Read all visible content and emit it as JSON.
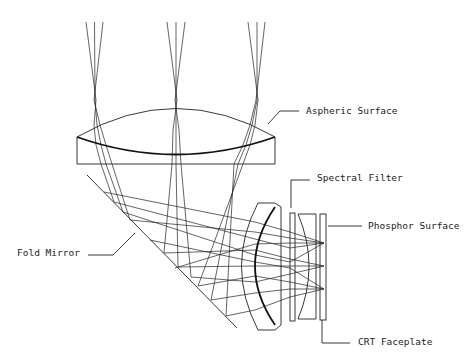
{
  "diagram": {
    "labels": {
      "aspheric_surface": "Aspheric Surface",
      "spectral_filter": "Spectral Filter",
      "phosphor_surface": "Phosphor Surface",
      "fold_mirror": "Fold Mirror",
      "crt_faceplate": "CRT Faceplate"
    },
    "components": [
      "Aspheric lens",
      "Fold mirror",
      "Meniscus lens",
      "Spectral filter",
      "Field flattener",
      "CRT faceplate",
      "Phosphor surface"
    ],
    "ray_bundles": 3,
    "rays_per_bundle": 3
  }
}
